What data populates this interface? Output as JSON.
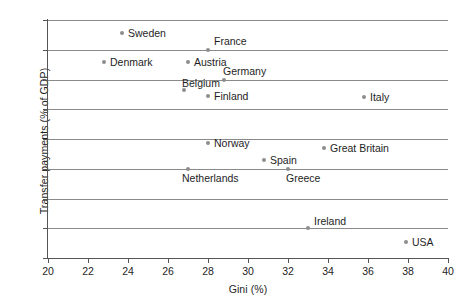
{
  "chart_data": {
    "type": "scatter",
    "title": "",
    "xlabel": "Gini (%)",
    "ylabel": "Transfer payments (% of GDP)",
    "xlim": [
      20,
      40
    ],
    "ylim": [
      15,
      31
    ],
    "xticks": [
      20,
      22,
      24,
      26,
      28,
      30,
      32,
      34,
      36,
      38,
      40
    ],
    "yticks": [
      15,
      17,
      19,
      21,
      23,
      25,
      27,
      29,
      31
    ],
    "grid": "horizontal",
    "legend": "none",
    "points": [
      {
        "label": "Sweden",
        "x": 23.7,
        "y": 30.1,
        "label_dx": 6,
        "label_dy": -6
      },
      {
        "label": "France",
        "x": 28.0,
        "y": 29.0,
        "label_dx": 6,
        "label_dy": -15
      },
      {
        "label": "Denmark",
        "x": 22.8,
        "y": 28.2,
        "label_dx": 6,
        "label_dy": -6
      },
      {
        "label": "Austria",
        "x": 27.0,
        "y": 28.2,
        "label_dx": 6,
        "label_dy": -6
      },
      {
        "label": "Germany",
        "x": 28.8,
        "y": 27.0,
        "label_dx": -1,
        "label_dy": -15
      },
      {
        "label": "Belgium",
        "x": 26.8,
        "y": 26.3,
        "label_dx": -2,
        "label_dy": -13
      },
      {
        "label": "Finland",
        "x": 28.0,
        "y": 25.9,
        "label_dx": 6,
        "label_dy": -6
      },
      {
        "label": "Italy",
        "x": 35.8,
        "y": 25.8,
        "label_dx": 6,
        "label_dy": -6
      },
      {
        "label": "Norway",
        "x": 28.0,
        "y": 22.7,
        "label_dx": 6,
        "label_dy": -6
      },
      {
        "label": "Great Britain",
        "x": 33.8,
        "y": 22.4,
        "label_dx": 6,
        "label_dy": -6
      },
      {
        "label": "Spain",
        "x": 30.8,
        "y": 21.6,
        "label_dx": 6,
        "label_dy": -6
      },
      {
        "label": "Greece",
        "x": 32.0,
        "y": 21.0,
        "label_dx": -2,
        "label_dy": 3
      },
      {
        "label": "Netherlands",
        "x": 27.0,
        "y": 21.0,
        "label_dx": -6,
        "label_dy": 3
      },
      {
        "label": "Ireland",
        "x": 33.0,
        "y": 17.0,
        "label_dx": 6,
        "label_dy": -13
      },
      {
        "label": "USA",
        "x": 37.9,
        "y": 16.1,
        "label_dx": 6,
        "label_dy": -6
      }
    ]
  },
  "colors": {
    "marker": "#8d8d8d",
    "gridline": "#8a8a8a",
    "axis": "#555555",
    "text": "#1e1e1e",
    "background": "#ffffff"
  }
}
